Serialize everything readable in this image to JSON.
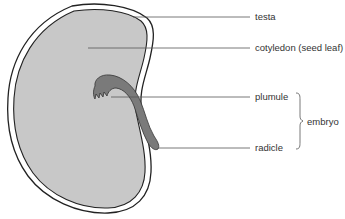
{
  "diagram": {
    "labels": {
      "testa": "testa",
      "cotyledon": "cotyledon (seed leaf)",
      "plumule": "plumule",
      "radicle": "radicle",
      "embryo": "embryo"
    },
    "groups": [
      {
        "name": "embryo",
        "members": [
          "plumule",
          "radicle"
        ]
      }
    ],
    "colors": {
      "background": "#ffffff",
      "outline": "#222222",
      "cotyledon_fill": "#c8c8c8",
      "embryo_fill": "#7a7a7a",
      "leader_line": "#555555",
      "text": "#333333"
    }
  }
}
